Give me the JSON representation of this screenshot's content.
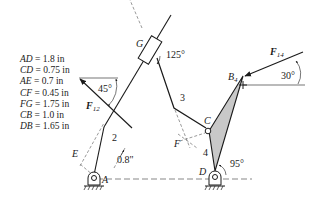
{
  "figure": {
    "dimensions": [
      {
        "name": "AD",
        "value": "1.8 in"
      },
      {
        "name": "CD",
        "value": "0.75 in"
      },
      {
        "name": "AE",
        "value": "0.7 in"
      },
      {
        "name": "CF",
        "value": "0.45 in"
      },
      {
        "name": "FG",
        "value": "1.75 in"
      },
      {
        "name": "CB",
        "value": "1.0 in"
      },
      {
        "name": "DB",
        "value": "1.65 in"
      }
    ],
    "points": {
      "A": "A",
      "B": "B",
      "B_sub": "4",
      "C": "C",
      "D": "D",
      "E": "E",
      "F": "F",
      "G": "G"
    },
    "links": {
      "link2": "2",
      "link3": "3",
      "link4": "4"
    },
    "forces": {
      "F12": {
        "symbol": "F",
        "sub": "12"
      },
      "F14": {
        "symbol": "F",
        "sub": "14"
      }
    },
    "angles": {
      "slider_angle": "125°",
      "f12_angle": "45°",
      "f14_angle": "30°",
      "link4_angle": "95°"
    },
    "distances": {
      "offset": "0.8\""
    },
    "colors": {
      "line": "#1a1a1a",
      "link4_fill": "#c8c8c8",
      "dashed": "#555555"
    }
  }
}
